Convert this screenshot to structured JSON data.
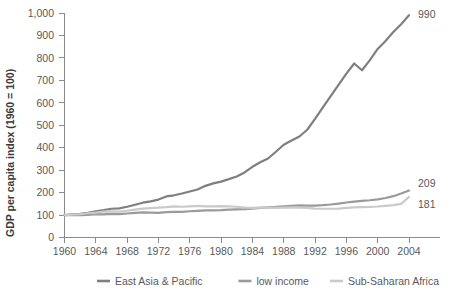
{
  "chart_data": {
    "type": "line",
    "title": "",
    "xlabel": "",
    "ylabel": "GDP per capita index (1960 = 100)",
    "xlim": [
      1960,
      2004
    ],
    "ylim": [
      0,
      1000
    ],
    "grid": false,
    "legend_position": "bottom",
    "x_ticks": [
      1960,
      1964,
      1968,
      1972,
      1976,
      1980,
      1984,
      1988,
      1992,
      1996,
      2000,
      2004
    ],
    "x_tick_labels": [
      "1960",
      "1964",
      "1968",
      "1972",
      "1976",
      "1980",
      "1984",
      "1988",
      "1992",
      "1996",
      "2000",
      "2004"
    ],
    "y_ticks": [
      0,
      100,
      200,
      300,
      400,
      500,
      600,
      700,
      800,
      900,
      1000
    ],
    "y_tick_labels": [
      "0",
      "100",
      "200",
      "300",
      "400",
      "500",
      "600",
      "700",
      "800",
      "900",
      "1,000"
    ],
    "x": [
      1960,
      1961,
      1962,
      1963,
      1964,
      1965,
      1966,
      1967,
      1968,
      1969,
      1970,
      1971,
      1972,
      1973,
      1974,
      1975,
      1976,
      1977,
      1978,
      1979,
      1980,
      1981,
      1982,
      1983,
      1984,
      1985,
      1986,
      1987,
      1988,
      1989,
      1990,
      1991,
      1992,
      1993,
      1994,
      1995,
      1996,
      1997,
      1998,
      1999,
      2000,
      2001,
      2002,
      2003,
      2004
    ],
    "series": [
      {
        "name": "East Asia & Pacific",
        "color": "#7f7f81",
        "end_label": "990",
        "values": [
          100,
          103,
          105,
          110,
          117,
          122,
          128,
          130,
          137,
          146,
          155,
          161,
          169,
          183,
          188,
          196,
          205,
          214,
          230,
          241,
          249,
          260,
          272,
          290,
          315,
          335,
          352,
          382,
          413,
          432,
          450,
          480,
          528,
          580,
          630,
          680,
          730,
          775,
          745,
          790,
          840,
          875,
          915,
          950,
          990
        ]
      },
      {
        "name": "low income",
        "color": "#9a9a9c",
        "end_label": "209",
        "values": [
          100,
          100,
          99,
          101,
          104,
          103,
          105,
          104,
          107,
          110,
          112,
          111,
          110,
          113,
          114,
          114,
          117,
          119,
          121,
          121,
          122,
          124,
          125,
          126,
          129,
          132,
          134,
          136,
          139,
          141,
          143,
          142,
          142,
          144,
          147,
          151,
          156,
          160,
          163,
          166,
          170,
          176,
          184,
          196,
          209
        ]
      },
      {
        "name": "Sub-Saharan Africa",
        "color": "#cacacc",
        "end_label": "181",
        "values": [
          100,
          102,
          104,
          108,
          111,
          115,
          116,
          115,
          119,
          124,
          129,
          131,
          133,
          135,
          139,
          137,
          139,
          141,
          139,
          139,
          140,
          139,
          137,
          133,
          132,
          133,
          133,
          132,
          133,
          134,
          133,
          132,
          129,
          128,
          128,
          129,
          132,
          134,
          135,
          136,
          138,
          141,
          144,
          150,
          181
        ]
      }
    ]
  },
  "legend": {
    "items": [
      {
        "label": "East Asia & Pacific",
        "color": "#7f7f81"
      },
      {
        "label": "low income",
        "color": "#9a9a9c"
      },
      {
        "label": "Sub-Saharan Africa",
        "color": "#cacacc"
      }
    ]
  }
}
